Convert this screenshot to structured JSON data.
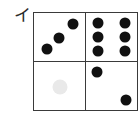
{
  "canvas": {
    "width": 140,
    "height": 120,
    "background_color": "#ffffff"
  },
  "label": {
    "text": "イ",
    "name": "item-label-i",
    "color": "#2b2b2b"
  },
  "grid": {
    "rows": 2,
    "columns": 2,
    "border_color": "#3a3a3a",
    "border_width_px": 1.5,
    "cell_background": "#ffffff",
    "dot_color": "#111111",
    "faint_dot_color": "#e9e9e9",
    "cells": [
      {
        "name": "cell-top-left",
        "position": "top-left",
        "dot_count": 3,
        "pattern": "ascending-diagonal",
        "dots": [
          {
            "cx_pct": 25,
            "cy_pct": 76,
            "d_px": 11,
            "faint": false
          },
          {
            "cx_pct": 50,
            "cy_pct": 52,
            "d_px": 11,
            "faint": false
          },
          {
            "cx_pct": 77,
            "cy_pct": 24,
            "d_px": 11,
            "faint": false
          }
        ]
      },
      {
        "name": "cell-top-right",
        "position": "top-right",
        "dot_count": 6,
        "pattern": "two-columns-three-rows",
        "dots": [
          {
            "cx_pct": 24,
            "cy_pct": 20,
            "d_px": 11,
            "faint": false
          },
          {
            "cx_pct": 76,
            "cy_pct": 20,
            "d_px": 11,
            "faint": false
          },
          {
            "cx_pct": 24,
            "cy_pct": 50,
            "d_px": 11,
            "faint": false
          },
          {
            "cx_pct": 76,
            "cy_pct": 50,
            "d_px": 11,
            "faint": false
          },
          {
            "cx_pct": 24,
            "cy_pct": 80,
            "d_px": 11,
            "faint": false
          },
          {
            "cx_pct": 76,
            "cy_pct": 80,
            "d_px": 11,
            "faint": false
          }
        ]
      },
      {
        "name": "cell-bottom-left",
        "position": "bottom-left",
        "dot_count": 1,
        "pattern": "center-faint",
        "dots": [
          {
            "cx_pct": 51,
            "cy_pct": 52,
            "d_px": 15,
            "faint": true
          }
        ]
      },
      {
        "name": "cell-bottom-right",
        "position": "bottom-right",
        "dot_count": 2,
        "pattern": "descending-diagonal",
        "dots": [
          {
            "cx_pct": 23,
            "cy_pct": 22,
            "d_px": 11,
            "faint": false
          },
          {
            "cx_pct": 78,
            "cy_pct": 79,
            "d_px": 11,
            "faint": false
          }
        ]
      }
    ]
  }
}
